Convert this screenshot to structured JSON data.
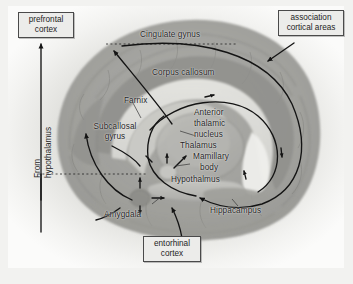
{
  "figure": {
    "background_color": "#f2f2f0",
    "ink_color": "#232323",
    "box_fill": "#ececea",
    "box_border": "#4a4a4a"
  },
  "callouts": [
    {
      "id": "prefrontal-cortex",
      "lines": [
        "prefrontal",
        "cortex"
      ],
      "text": "prefrontal cortex"
    },
    {
      "id": "association-cortical-areas",
      "lines": [
        "association",
        "cortical areas"
      ],
      "text": "association cortical areas"
    },
    {
      "id": "entorhinal-cortex",
      "lines": [
        "entorhinal",
        "cortex"
      ],
      "text": "entorhinal cortex"
    }
  ],
  "labels": {
    "cingulate_gyrus": "Cingulate gynus",
    "corpus_callosum": "Corpus callosum",
    "fornix": "Farnix",
    "subcallosal_gyrus_line1": "Subcallosal",
    "subcallosal_gyrus_line2": "gyrus",
    "anterior_thalamic_nucleus_line1": "Anterior",
    "anterior_thalamic_nucleus_line2": "thalamic",
    "anterior_thalamic_nucleus_line3": "nucleus",
    "thalamus": "Thalamus",
    "mamillary_body_line1": "Mamillary",
    "mamillary_body_line2": "body",
    "hypothalamus": "Hypothalmus",
    "amygdala": "Amygdala",
    "hippocampus": "Hippacampus",
    "from_hypothalamus_line1": "From",
    "from_hypothalamus_line2": "hypothalamus"
  }
}
